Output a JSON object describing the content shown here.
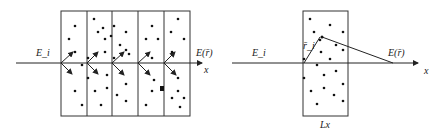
{
  "left_panel": {
    "incident_label": "E_i",
    "output_label": "E(r̄)",
    "axis_label": "x",
    "slab_count": 5
  },
  "right_panel": {
    "incident_label": "E_i",
    "position_label": "r̄_i",
    "output_label": "E(r̄)",
    "axis_label": "x",
    "thickness_label": "Lx"
  },
  "colors": {
    "stroke": "#222222",
    "background": "#ffffff"
  }
}
